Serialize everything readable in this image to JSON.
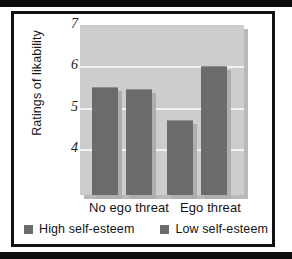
{
  "chart_data": {
    "type": "bar",
    "title": "",
    "xlabel": "",
    "ylabel": "Ratings of likability",
    "categories": [
      "No ego threat",
      "Ego threat"
    ],
    "series": [
      {
        "name": "High self-esteem",
        "values": [
          5.5,
          4.7
        ],
        "color": "#6b6b6b"
      },
      {
        "name": "Low self-esteem",
        "values": [
          5.45,
          6.0
        ],
        "color": "#6b6b6b"
      }
    ],
    "ylim": [
      2.9,
      7.0
    ],
    "yticks": [
      7,
      6,
      5,
      4
    ],
    "ytick_labels": [
      "7",
      "6",
      "5",
      "4"
    ],
    "grid": true,
    "legend_position": "bottom",
    "plot_background": "#cdcdcd",
    "gridline_color": "#f2f2f2",
    "frame_color": "#111111"
  },
  "axis": {
    "y_title": "Ratings of likability",
    "ticks": [
      {
        "label": "7",
        "value": 7
      },
      {
        "label": "6",
        "value": 6
      },
      {
        "label": "5",
        "value": 5
      },
      {
        "label": "4",
        "value": 4
      }
    ]
  },
  "groups": [
    {
      "label": "No ego threat"
    },
    {
      "label": "Ego threat"
    }
  ],
  "legend": {
    "items": [
      {
        "label": "High self-esteem",
        "color": "#6b6b6b"
      },
      {
        "label": "Low self-esteem",
        "color": "#6b6b6b"
      }
    ]
  }
}
